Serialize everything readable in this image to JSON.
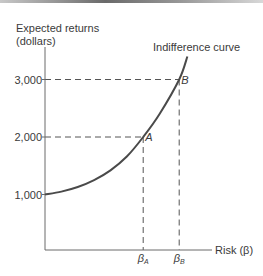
{
  "chart_data": {
    "type": "line",
    "title": "",
    "ylabel_line1": "Expected returns",
    "ylabel_line2": "(dollars)",
    "xlabel": "Risk (β)",
    "curve_label": "Indifference curve",
    "y_ticks": [
      {
        "value": 1000,
        "label": "1,000"
      },
      {
        "value": 2000,
        "label": "2,000"
      },
      {
        "value": 3000,
        "label": "3,000"
      }
    ],
    "x_ticks": [
      {
        "name": "beta-a",
        "label_base": "β",
        "label_sub": "A",
        "x": 0.6
      },
      {
        "name": "beta-b",
        "label_base": "β",
        "label_sub": "B",
        "x": 0.82
      }
    ],
    "xlim": [
      0,
      1
    ],
    "ylim": [
      0,
      3400
    ],
    "series": [
      {
        "name": "Indifference curve",
        "x": [
          0,
          0.1,
          0.2,
          0.3,
          0.4,
          0.5,
          0.6,
          0.7,
          0.82,
          0.87
        ],
        "y": [
          1000,
          1050,
          1130,
          1250,
          1420,
          1660,
          2000,
          2400,
          3000,
          3400
        ]
      }
    ],
    "points": [
      {
        "label": "A",
        "x": 0.6,
        "y": 2000
      },
      {
        "label": "B",
        "x": 0.82,
        "y": 3000
      }
    ],
    "grid": false,
    "colors": {
      "curve": "#4a4a4a",
      "axes": "#6a6a6a",
      "dashes": "#555555"
    }
  }
}
